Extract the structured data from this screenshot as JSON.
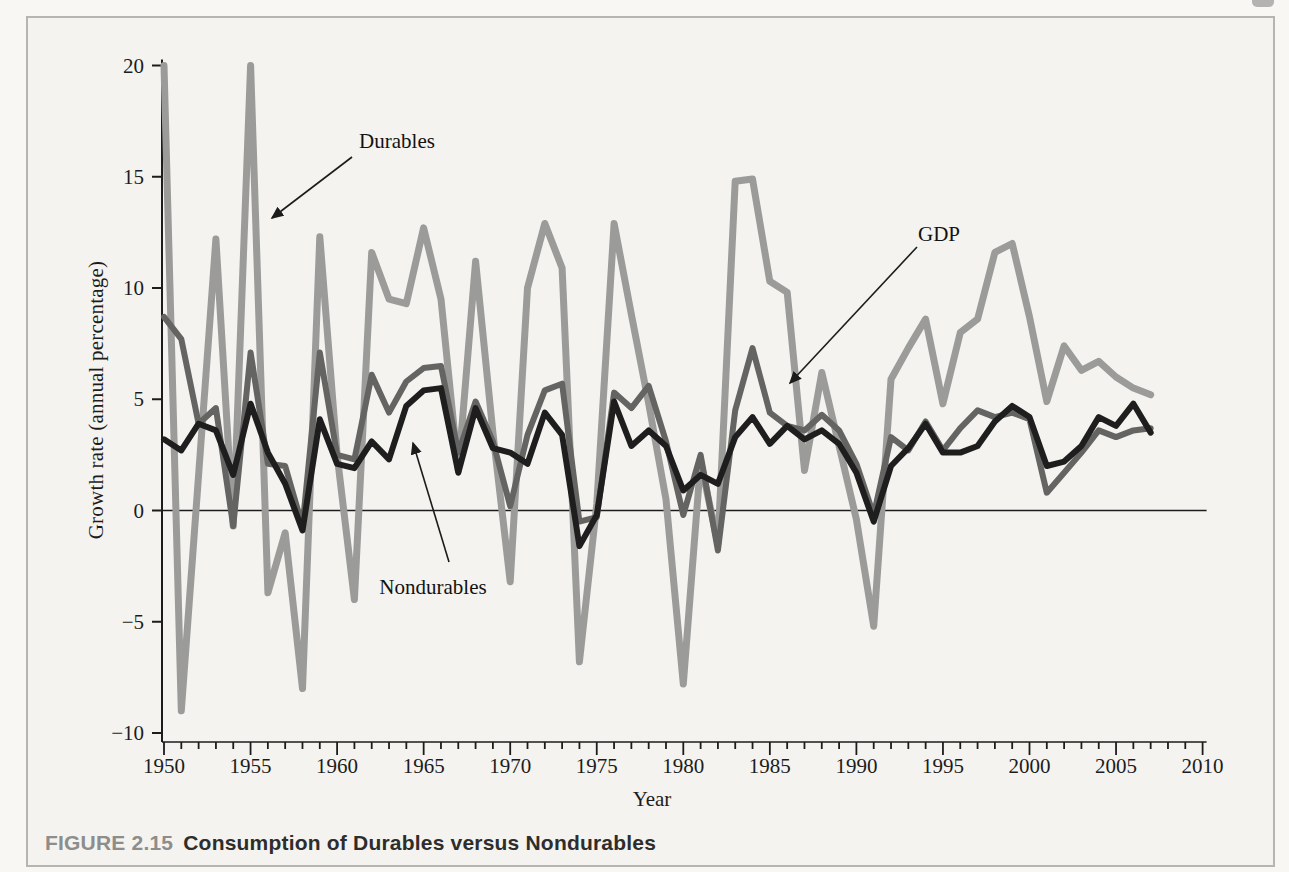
{
  "figure": {
    "caption_label": "FIGURE 2.15",
    "caption_title": "Consumption of Durables versus Nondurables"
  },
  "chart_data": {
    "type": "line",
    "title": "",
    "xlabel": "Year",
    "ylabel": "Growth rate (annual percentage)",
    "xlim": [
      1950,
      2010
    ],
    "ylim": [
      -10,
      20
    ],
    "x_ticks_major": [
      1950,
      1955,
      1960,
      1965,
      1970,
      1975,
      1980,
      1985,
      1990,
      1995,
      2000,
      2005,
      2010
    ],
    "x_minor_step": 1,
    "y_ticks": [
      20,
      15,
      10,
      5,
      0,
      -5,
      -10
    ],
    "grid": false,
    "zero_line": true,
    "legend_position": "none",
    "x": [
      1950,
      1951,
      1952,
      1953,
      1954,
      1955,
      1956,
      1957,
      1958,
      1959,
      1960,
      1961,
      1962,
      1963,
      1964,
      1965,
      1966,
      1967,
      1968,
      1969,
      1970,
      1971,
      1972,
      1973,
      1974,
      1975,
      1976,
      1977,
      1978,
      1979,
      1980,
      1981,
      1982,
      1983,
      1984,
      1985,
      1986,
      1987,
      1988,
      1989,
      1990,
      1991,
      1992,
      1993,
      1994,
      1995,
      1996,
      1997,
      1998,
      1999,
      2000,
      2001,
      2002,
      2003,
      2004,
      2005,
      2006,
      2007
    ],
    "series": [
      {
        "name": "Durables",
        "color": "#9b9b99",
        "width": 7,
        "values": [
          20.0,
          -9.0,
          1.6,
          12.2,
          -0.7,
          20.0,
          -3.7,
          -1.0,
          -8.0,
          12.3,
          2.5,
          -4.0,
          11.6,
          9.5,
          9.3,
          12.7,
          9.5,
          1.8,
          11.2,
          3.5,
          -3.2,
          10.0,
          12.9,
          10.9,
          -6.8,
          0.3,
          12.9,
          8.8,
          4.8,
          0.5,
          -7.8,
          2.2,
          -1.5,
          14.8,
          14.9,
          10.3,
          9.8,
          1.8,
          6.2,
          2.9,
          -0.4,
          -5.2,
          5.9,
          7.3,
          8.6,
          4.8,
          8.0,
          8.6,
          11.6,
          12.0,
          8.7,
          4.9,
          7.4,
          6.3,
          6.7,
          6.0,
          5.5,
          5.2
        ]
      },
      {
        "name": "GDP",
        "color": "#646462",
        "width": 6,
        "values": [
          8.7,
          7.7,
          3.9,
          4.6,
          -0.7,
          7.1,
          2.1,
          2.0,
          -0.7,
          7.1,
          2.5,
          2.3,
          6.1,
          4.4,
          5.8,
          6.4,
          6.5,
          2.6,
          4.9,
          3.1,
          0.2,
          3.4,
          5.4,
          5.7,
          -0.5,
          -0.3,
          5.3,
          4.6,
          5.6,
          3.1,
          -0.2,
          2.5,
          -1.8,
          4.5,
          7.3,
          4.4,
          3.8,
          3.6,
          4.3,
          3.6,
          2.1,
          -0.2,
          3.3,
          2.7,
          4.0,
          2.7,
          3.7,
          4.5,
          4.2,
          4.4,
          4.1,
          0.8,
          1.7,
          2.6,
          3.6,
          3.3,
          3.6,
          3.7
        ]
      },
      {
        "name": "Nondurables",
        "color": "#1e1e1e",
        "width": 6,
        "values": [
          3.2,
          2.7,
          3.9,
          3.6,
          1.6,
          4.8,
          2.6,
          1.2,
          -0.9,
          4.1,
          2.1,
          1.9,
          3.1,
          2.3,
          4.7,
          5.4,
          5.5,
          1.7,
          4.6,
          2.8,
          2.6,
          2.1,
          4.4,
          3.4,
          -1.6,
          -0.2,
          4.9,
          2.9,
          3.6,
          2.9,
          0.9,
          1.6,
          1.2,
          3.3,
          4.2,
          3.0,
          3.8,
          3.2,
          3.6,
          3.0,
          1.7,
          -0.5,
          2.0,
          2.8,
          3.9,
          2.6,
          2.6,
          2.9,
          4.0,
          4.7,
          4.2,
          2.0,
          2.2,
          2.9,
          4.2,
          3.8,
          4.8,
          3.5
        ]
      }
    ],
    "annotations": [
      {
        "label": "Durables",
        "text_x": 397,
        "text_y": 141,
        "arrow_from": [
          352,
          157
        ],
        "arrow_to": [
          272,
          218
        ]
      },
      {
        "label": "GDP",
        "text_x": 939,
        "text_y": 234,
        "arrow_from": [
          917,
          247
        ],
        "arrow_to": [
          790,
          383
        ]
      },
      {
        "label": "Nondurables",
        "text_x": 433,
        "text_y": 587,
        "arrow_from": [
          449,
          562
        ],
        "arrow_to": [
          413,
          443
        ]
      }
    ],
    "axis_color": "#1c1c1c"
  }
}
